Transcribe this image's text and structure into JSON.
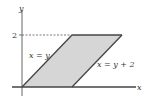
{
  "diagram": {
    "type": "region-plot",
    "axes": {
      "x_label": "x",
      "y_label": "y",
      "y_tick": "2"
    },
    "region": {
      "shape": "parallelogram",
      "vertices": [
        [
          0,
          0
        ],
        [
          2,
          2
        ],
        [
          4,
          2
        ],
        [
          2,
          0
        ]
      ],
      "fill": "#d4d4d4",
      "stroke": "#444444"
    },
    "curves": [
      {
        "label": "x = y",
        "equation": "x = y"
      },
      {
        "label": "x = y + 2",
        "equation": "x = y + 2"
      }
    ],
    "guide": {
      "style": "dashed",
      "from": [
        0,
        2
      ],
      "to": [
        2,
        2
      ]
    }
  }
}
